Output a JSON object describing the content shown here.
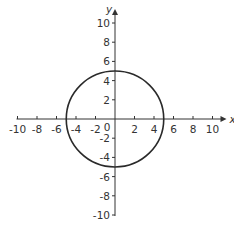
{
  "chart_data": {
    "type": "line",
    "title": "",
    "xlabel": "x",
    "ylabel": "y",
    "xlim": [
      -10,
      10
    ],
    "ylim": [
      -10,
      10
    ],
    "grid": false,
    "x_ticks": [
      -10,
      -8,
      -6,
      -4,
      -2,
      2,
      4,
      6,
      8,
      10
    ],
    "y_ticks": [
      10,
      8,
      6,
      4,
      2,
      -2,
      -4,
      -6,
      -8,
      -10
    ],
    "origin_label": "0",
    "series": [
      {
        "name": "circle",
        "shape": "circle",
        "center": [
          0,
          0
        ],
        "radius": 5,
        "equation": "x^2 + y^2 = 25"
      }
    ],
    "colors": {
      "axis": "#333333",
      "curve": "#2a2a2a"
    }
  }
}
